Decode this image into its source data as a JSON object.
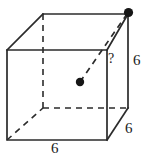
{
  "figure": {
    "type": "geometry-diagram",
    "shape": "cube",
    "stroke_color": "#2b2b2b",
    "background_color": "#ffffff",
    "labels": {
      "bottom_edge": "6",
      "right_vertical_edge": "6",
      "bottom_right_depth_edge": "6",
      "unknown_segment": "?"
    },
    "points": {
      "center_dot": "center of cube",
      "vertex_dot": "back top right vertex"
    }
  }
}
